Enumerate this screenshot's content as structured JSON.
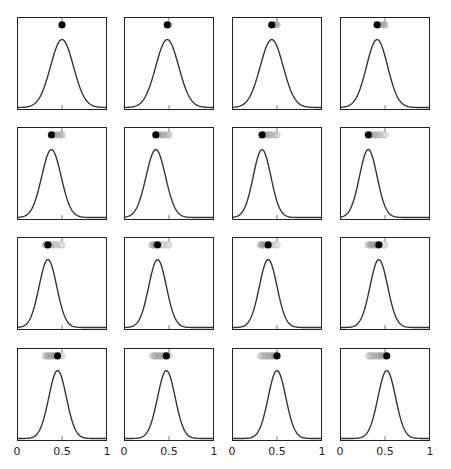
{
  "chart_data": {
    "type": "line",
    "title": "",
    "xlabel": "",
    "ylabel": "",
    "xlim": [
      0,
      1
    ],
    "grid": false,
    "layout": {
      "rows": 4,
      "cols": 4
    },
    "x_tick_labels": [
      "0",
      "0.5",
      "1"
    ],
    "x_ticks": [
      0,
      0.5,
      1
    ],
    "panels": [
      {
        "mean": 0.5,
        "sd": 0.13,
        "trail": [
          0.5
        ]
      },
      {
        "mean": 0.48,
        "sd": 0.13,
        "trail": [
          0.5,
          0.48
        ]
      },
      {
        "mean": 0.44,
        "sd": 0.13,
        "trail": [
          0.5,
          0.48,
          0.44
        ]
      },
      {
        "mean": 0.41,
        "sd": 0.12,
        "trail": [
          0.5,
          0.48,
          0.44,
          0.41
        ]
      },
      {
        "mean": 0.38,
        "sd": 0.11,
        "trail": [
          0.5,
          0.48,
          0.44,
          0.41,
          0.38
        ]
      },
      {
        "mean": 0.35,
        "sd": 0.11,
        "trail": [
          0.5,
          0.48,
          0.44,
          0.41,
          0.38,
          0.35
        ]
      },
      {
        "mean": 0.33,
        "sd": 0.1,
        "trail": [
          0.5,
          0.48,
          0.44,
          0.41,
          0.38,
          0.35,
          0.33
        ]
      },
      {
        "mean": 0.31,
        "sd": 0.1,
        "trail": [
          0.5,
          0.48,
          0.44,
          0.41,
          0.38,
          0.35,
          0.33,
          0.31
        ]
      },
      {
        "mean": 0.34,
        "sd": 0.1,
        "trail": [
          0.5,
          0.48,
          0.44,
          0.41,
          0.38,
          0.35,
          0.33,
          0.31,
          0.34
        ]
      },
      {
        "mean": 0.37,
        "sd": 0.1,
        "trail": [
          0.5,
          0.48,
          0.44,
          0.41,
          0.38,
          0.35,
          0.33,
          0.31,
          0.34,
          0.37
        ]
      },
      {
        "mean": 0.4,
        "sd": 0.1,
        "trail": [
          0.5,
          0.48,
          0.44,
          0.41,
          0.38,
          0.35,
          0.33,
          0.31,
          0.34,
          0.37,
          0.4
        ]
      },
      {
        "mean": 0.43,
        "sd": 0.1,
        "trail": [
          0.5,
          0.48,
          0.44,
          0.41,
          0.38,
          0.35,
          0.33,
          0.31,
          0.34,
          0.37,
          0.4,
          0.43
        ]
      },
      {
        "mean": 0.45,
        "sd": 0.1,
        "trail": [
          0.5,
          0.48,
          0.44,
          0.41,
          0.38,
          0.35,
          0.33,
          0.31,
          0.34,
          0.37,
          0.4,
          0.43,
          0.45
        ]
      },
      {
        "mean": 0.47,
        "sd": 0.1,
        "trail": [
          0.5,
          0.48,
          0.44,
          0.41,
          0.38,
          0.35,
          0.33,
          0.31,
          0.34,
          0.37,
          0.4,
          0.43,
          0.45,
          0.47
        ]
      },
      {
        "mean": 0.5,
        "sd": 0.1,
        "trail": [
          0.5,
          0.48,
          0.44,
          0.41,
          0.38,
          0.35,
          0.33,
          0.31,
          0.34,
          0.37,
          0.4,
          0.43,
          0.45,
          0.47,
          0.5
        ]
      },
      {
        "mean": 0.52,
        "sd": 0.1,
        "trail": [
          0.5,
          0.48,
          0.44,
          0.41,
          0.38,
          0.35,
          0.33,
          0.31,
          0.34,
          0.37,
          0.4,
          0.43,
          0.45,
          0.47,
          0.5,
          0.52
        ]
      }
    ],
    "colors": {
      "curve": "#333333",
      "frame": "#222222",
      "marker": "#000000"
    }
  }
}
